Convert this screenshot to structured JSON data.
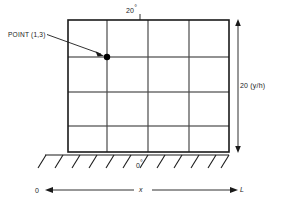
{
  "figure": {
    "title_alt": "Rectangular domain grid with boundary conditions",
    "labels": {
      "point_label": "POINT (1,3)",
      "top_boundary": "20",
      "top_boundary_unit": "°",
      "right_dimension": "20 (y/h)",
      "bottom_boundary": "0",
      "bottom_boundary_unit": "°",
      "axis_origin": "0",
      "axis_name": "x",
      "axis_end": "L"
    },
    "colors": {
      "outline": "#1a1a1a",
      "gridline": "#6e6e6e",
      "marker": "#000000",
      "text": "#1a1a1a",
      "background": "#ffffff"
    },
    "geometry": {
      "rect": {
        "x": 68,
        "y": 20,
        "width": 161,
        "height": 132
      },
      "columns": 4,
      "rows": 4,
      "vertical_gridlines_x": [
        107,
        148,
        189
      ],
      "horizontal_gridlines_y": [
        57,
        92,
        126
      ],
      "marker_point": {
        "x": 107,
        "y": 57,
        "radius": 3.2
      },
      "leader_line": {
        "x1": 47,
        "y1": 35,
        "x2": 104,
        "y2": 55
      },
      "top_tick": {
        "x": 140,
        "y1": 15,
        "y2": 20
      },
      "dimension_arrow": {
        "x": 238,
        "y_top": 20,
        "y_bottom": 152
      },
      "hatch_count": 11,
      "hatch_baseline_y": 155,
      "hatch_x_start": 45,
      "hatch_x_end": 229,
      "x_axis": {
        "y": 190,
        "x_start": 46,
        "x_end": 237
      }
    }
  }
}
